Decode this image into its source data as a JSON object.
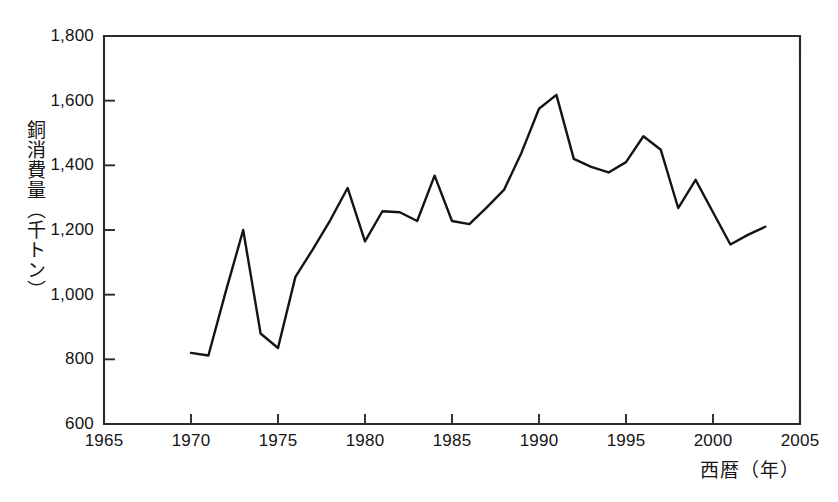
{
  "chart_data": {
    "type": "line",
    "title": "",
    "xlabel": "西暦（年）",
    "ylabel": "銅消費量（千トン）",
    "xlim": [
      1965,
      2005
    ],
    "ylim": [
      600,
      1800
    ],
    "grid": false,
    "legend": false,
    "xticks": [
      1965,
      1970,
      1975,
      1980,
      1985,
      1990,
      1995,
      2000,
      2005
    ],
    "xtick_labels": [
      "1965",
      "1970",
      "1975",
      "1980",
      "1985",
      "1990",
      "1995",
      "2000",
      "2005"
    ],
    "yticks": [
      600,
      800,
      1000,
      1200,
      1400,
      1600,
      1800
    ],
    "ytick_labels": [
      "600",
      "800",
      "1,000",
      "1,200",
      "1,400",
      "1,600",
      "1,800"
    ],
    "line_color": "#141414",
    "series": [
      {
        "name": "銅消費量",
        "x": [
          1970,
          1971,
          1972,
          1973,
          1974,
          1975,
          1976,
          1977,
          1978,
          1979,
          1980,
          1981,
          1982,
          1983,
          1984,
          1985,
          1986,
          1987,
          1988,
          1989,
          1990,
          1991,
          1992,
          1993,
          1994,
          1995,
          1996,
          1997,
          1998,
          1999,
          2000,
          2001,
          2002,
          2003
        ],
        "values": [
          820,
          812,
          1010,
          1200,
          880,
          835,
          1055,
          1140,
          1230,
          1330,
          1165,
          1258,
          1255,
          1228,
          1368,
          1228,
          1218,
          1270,
          1325,
          1440,
          1575,
          1618,
          1420,
          1395,
          1378,
          1410,
          1490,
          1448,
          1268,
          1355,
          1255,
          1155,
          1185,
          1210
        ]
      }
    ]
  }
}
